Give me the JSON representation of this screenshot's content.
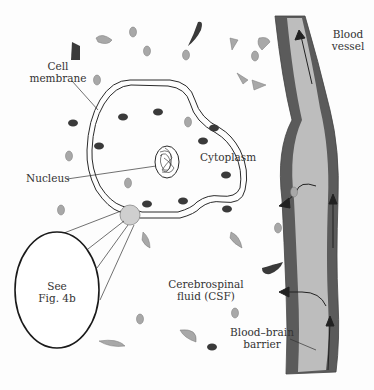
{
  "labels": {
    "cell_membrane": [
      "Cell",
      "membrane"
    ],
    "nucleus": "Nucleus",
    "cytoplasm": "Cytoplasm",
    "see_fig": [
      "See",
      "Fig. 4b"
    ],
    "csf": [
      "Cerebrospinal",
      "fluid (CSF)"
    ],
    "blood_vessel": [
      "Blood",
      "vessel"
    ],
    "bbb": [
      "Blood–brain",
      "barrier"
    ]
  },
  "colors": {
    "vessel_wall": "#5b5b5b",
    "vessel_lumen": "#bdbdbd",
    "particle_light": "#a8a8a8",
    "particle_dark": "#3a3a3a",
    "outline": "#2a2a2a"
  }
}
